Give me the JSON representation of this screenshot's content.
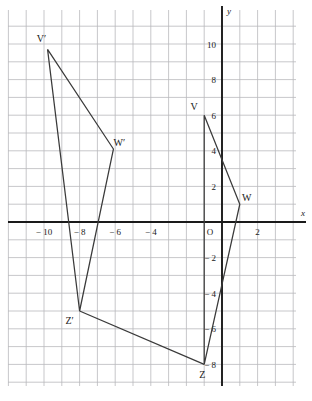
{
  "figure": {
    "background_color": "#ffffff",
    "grid_color": "#b9b9bd",
    "axis_color": "#1a1a1a",
    "shape_color": "#3a3a3a"
  },
  "chart_data": {
    "type": "scatter",
    "title": "",
    "xlabel": "x",
    "ylabel": "y",
    "grid": true,
    "legend": "none",
    "xlim": [
      -12,
      4
    ],
    "ylim": [
      -10,
      11
    ],
    "x_ticks": [
      -10,
      -8,
      -6,
      -4,
      2
    ],
    "x_tick_labels": [
      "− 10",
      "− 8",
      "− 6",
      "− 4",
      "2"
    ],
    "y_ticks": [
      10,
      8,
      6,
      4,
      2,
      -2,
      -4,
      -6,
      -8
    ],
    "y_tick_labels": [
      "10",
      "8",
      "6",
      "4",
      "2",
      "− 2",
      "− 4",
      "− 6",
      "− 8"
    ],
    "origin_label": "O",
    "grid_step": 1,
    "series": [
      {
        "name": "Triangle VWZ",
        "closed": true,
        "points": [
          {
            "label": "V",
            "x": -1,
            "y": 6
          },
          {
            "label": "W",
            "x": 1,
            "y": 1
          },
          {
            "label": "Z",
            "x": -1,
            "y": -8
          }
        ]
      },
      {
        "name": "Triangle V'W'Z'",
        "closed": true,
        "points": [
          {
            "label": "V′",
            "x": -9.8,
            "y": 9.7
          },
          {
            "label": "W′",
            "x": -6.1,
            "y": 4.1
          },
          {
            "label": "Z′",
            "x": -8,
            "y": -5
          }
        ]
      },
      {
        "name": "Connector Z′ to Z",
        "closed": false,
        "points": [
          {
            "label": "Z′",
            "x": -8,
            "y": -5
          },
          {
            "label": "Z",
            "x": -1,
            "y": -8
          }
        ]
      }
    ],
    "vertex_labels": [
      {
        "text": "V",
        "x": -1,
        "y": 6,
        "dx": -10,
        "dy": -5
      },
      {
        "text": "W",
        "x": 1,
        "y": 1,
        "dx": 7,
        "dy": -3
      },
      {
        "text": "Z",
        "x": -1,
        "y": -8,
        "dx": -2,
        "dy": 14
      },
      {
        "text": "V′",
        "x": -9.8,
        "y": 9.7,
        "dx": -6,
        "dy": -7
      },
      {
        "text": "W′",
        "x": -6.1,
        "y": 4.1,
        "dx": 6,
        "dy": -3
      },
      {
        "text": "Z′",
        "x": -8,
        "y": -5,
        "dx": -10,
        "dy": 13
      }
    ]
  }
}
